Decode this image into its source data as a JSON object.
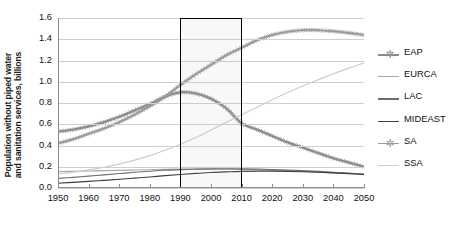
{
  "chart_data": {
    "type": "line",
    "title": "",
    "xlabel": "",
    "ylabel": "Population without piped water and sanitation services, billions",
    "ylabel_line1": "Population without piped water",
    "ylabel_line2": "and sanitation services, billions",
    "xlim": [
      1950,
      2050
    ],
    "ylim": [
      0.0,
      1.6
    ],
    "grid": true,
    "legend_position": "right",
    "ytick_labels": [
      "0.0",
      "0.2",
      "0.4",
      "0.6",
      "0.8",
      "1.0",
      "1.2",
      "1.4",
      "1.6"
    ],
    "ytick_values": [
      0.0,
      0.2,
      0.4,
      0.6,
      0.8,
      1.0,
      1.2,
      1.4,
      1.6
    ],
    "xtick_labels": [
      "1950",
      "1960",
      "1970",
      "1980",
      "1990",
      "2000",
      "2010",
      "2020",
      "2030",
      "2040",
      "2050"
    ],
    "xtick_values": [
      1950,
      1960,
      1970,
      1980,
      1990,
      2000,
      2010,
      2020,
      2030,
      2040,
      2050
    ],
    "x": [
      1950,
      1955,
      1960,
      1965,
      1970,
      1975,
      1980,
      1985,
      1990,
      1995,
      2000,
      2005,
      2010,
      2015,
      2020,
      2025,
      2030,
      2035,
      2040,
      2045,
      2050
    ],
    "series": [
      {
        "name": "EAP",
        "color": "#8a8a8a",
        "marker": "asterisk",
        "values": [
          0.53,
          0.55,
          0.58,
          0.62,
          0.67,
          0.73,
          0.79,
          0.86,
          0.9,
          0.89,
          0.84,
          0.75,
          0.61,
          0.55,
          0.49,
          0.43,
          0.38,
          0.33,
          0.28,
          0.24,
          0.2
        ]
      },
      {
        "name": "EURCA",
        "color": "#a8a8a8",
        "marker": "none",
        "values": [
          0.155,
          0.157,
          0.16,
          0.163,
          0.166,
          0.169,
          0.172,
          0.175,
          0.177,
          0.178,
          0.178,
          0.177,
          0.175,
          0.172,
          0.168,
          0.163,
          0.157,
          0.15,
          0.143,
          0.136,
          0.128
        ]
      },
      {
        "name": "LAC",
        "color": "#6d6d6d",
        "marker": "none",
        "values": [
          0.09,
          0.1,
          0.112,
          0.124,
          0.136,
          0.148,
          0.158,
          0.167,
          0.173,
          0.177,
          0.18,
          0.181,
          0.18,
          0.178,
          0.174,
          0.169,
          0.163,
          0.156,
          0.148,
          0.14,
          0.131
        ]
      },
      {
        "name": "MIDEAST",
        "color": "#3f3f3f",
        "marker": "none",
        "values": [
          0.045,
          0.053,
          0.062,
          0.072,
          0.082,
          0.093,
          0.104,
          0.116,
          0.127,
          0.137,
          0.146,
          0.152,
          0.157,
          0.159,
          0.159,
          0.157,
          0.153,
          0.148,
          0.142,
          0.135,
          0.127
        ]
      },
      {
        "name": "SA",
        "color": "#9a9a9a",
        "marker": "asterisk",
        "values": [
          0.42,
          0.46,
          0.51,
          0.56,
          0.62,
          0.69,
          0.77,
          0.86,
          0.97,
          1.07,
          1.16,
          1.25,
          1.32,
          1.39,
          1.44,
          1.47,
          1.485,
          1.485,
          1.475,
          1.46,
          1.44
        ]
      },
      {
        "name": "SSA",
        "color": "#cccccc",
        "marker": "none",
        "values": [
          0.135,
          0.15,
          0.17,
          0.195,
          0.225,
          0.262,
          0.305,
          0.355,
          0.412,
          0.475,
          0.545,
          0.618,
          0.69,
          0.76,
          0.83,
          0.898,
          0.96,
          1.018,
          1.075,
          1.128,
          1.178
        ]
      }
    ],
    "annotations": [
      {
        "type": "rectangle",
        "name": "highlight-box",
        "x_start": 1990,
        "x_end": 2010,
        "y_start": 0.0,
        "y_end": 1.6,
        "border_color": "#000000",
        "fill_color": "#aaaaaa"
      }
    ]
  },
  "legend": {
    "items": [
      {
        "label": "EAP",
        "color": "#8a8a8a",
        "marker": "asterisk"
      },
      {
        "label": "EURCA",
        "color": "#a8a8a8",
        "marker": "none"
      },
      {
        "label": "LAC",
        "color": "#6d6d6d",
        "marker": "none"
      },
      {
        "label": "MIDEAST",
        "color": "#3f3f3f",
        "marker": "none"
      },
      {
        "label": "SA",
        "color": "#9a9a9a",
        "marker": "asterisk"
      },
      {
        "label": "SSA",
        "color": "#cccccc",
        "marker": "none"
      }
    ]
  }
}
